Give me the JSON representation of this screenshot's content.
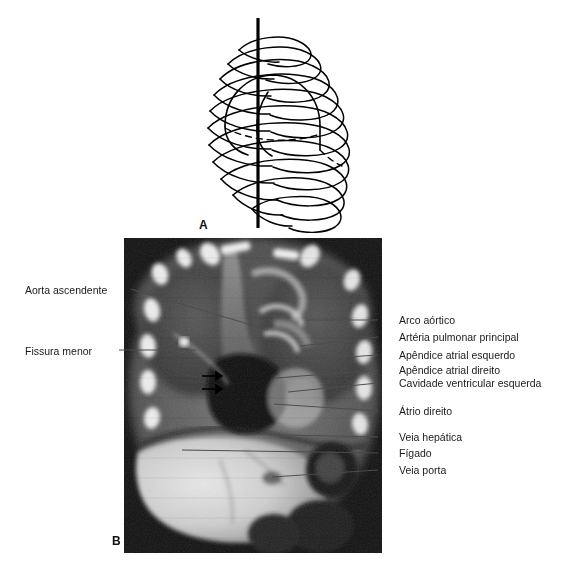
{
  "figure": {
    "panel_a": {
      "letter": "A",
      "caption_icon": "ribcage-coronal-plane-diagram"
    },
    "panel_b": {
      "letter": "B",
      "caption_icon": "coronal-mri-thorax-abdomen"
    }
  },
  "labels_left": [
    {
      "id": "aorta-ascendente",
      "text": "Aorta ascendente",
      "x": 25,
      "y": 284,
      "line": {
        "x1": 131,
        "y1": 289,
        "x2": 268,
        "y2": 330
      }
    },
    {
      "id": "fissura-menor",
      "text": "Fissura menor",
      "x": 25,
      "y": 345,
      "line": {
        "x1": 119,
        "y1": 350,
        "x2": 196,
        "y2": 350
      }
    }
  ],
  "labels_right": [
    {
      "id": "arco-aortico",
      "text": "Arco aórtico",
      "x": 399,
      "y": 314,
      "line": {
        "x1": 378,
        "y1": 320,
        "x2": 306,
        "y2": 320
      }
    },
    {
      "id": "arteria-pulmonar-principal",
      "text": "Artéria pulmonar principal",
      "x": 399,
      "y": 331,
      "line": {
        "x1": 378,
        "y1": 337,
        "x2": 300,
        "y2": 346
      }
    },
    {
      "id": "apendice-atrial-esquerdo",
      "text": "Apêndice atrial esquerdo",
      "x": 399,
      "y": 349,
      "line": {
        "x1": 378,
        "y1": 355,
        "x2": 286,
        "y2": 361
      }
    },
    {
      "id": "apendice-atrial-direito",
      "text": "Apêndice atrial direito",
      "x": 399,
      "y": 364,
      "line": {
        "x1": 378,
        "y1": 370,
        "x2": 276,
        "y2": 378
      }
    },
    {
      "id": "cavidade-ventricular-esquerda",
      "text": "Cavidade ventricular esquerda",
      "x": 399,
      "y": 377,
      "line": {
        "x1": 378,
        "y1": 383,
        "x2": 288,
        "y2": 392
      }
    },
    {
      "id": "atrio-direito",
      "text": "Átrio direito",
      "x": 399,
      "y": 405,
      "line": {
        "x1": 378,
        "y1": 411,
        "x2": 274,
        "y2": 404
      }
    },
    {
      "id": "veia-hepatica",
      "text": "Veia hepática",
      "x": 399,
      "y": 431,
      "line": {
        "x1": 378,
        "y1": 437,
        "x2": 236,
        "y2": 434
      }
    },
    {
      "id": "figado",
      "text": "Fígado",
      "x": 399,
      "y": 447,
      "line": {
        "x1": 378,
        "y1": 453,
        "x2": 182,
        "y2": 450
      }
    },
    {
      "id": "veia-porta",
      "text": "Veia porta",
      "x": 399,
      "y": 464,
      "line": {
        "x1": 378,
        "y1": 470,
        "x2": 272,
        "y2": 477
      }
    }
  ],
  "markers": {
    "fissure_arrows": [
      {
        "id": "fissure-arrow-upper",
        "x": 206,
        "y": 376
      },
      {
        "id": "fissure-arrow-lower",
        "x": 206,
        "y": 389
      }
    ]
  },
  "colors": {
    "background": "#ffffff",
    "text": "#1a1a1a",
    "leader_line": "#4d4d4d",
    "drawing_stroke": "#000000",
    "plane_line": "#000000",
    "mri_background": "#000000"
  }
}
